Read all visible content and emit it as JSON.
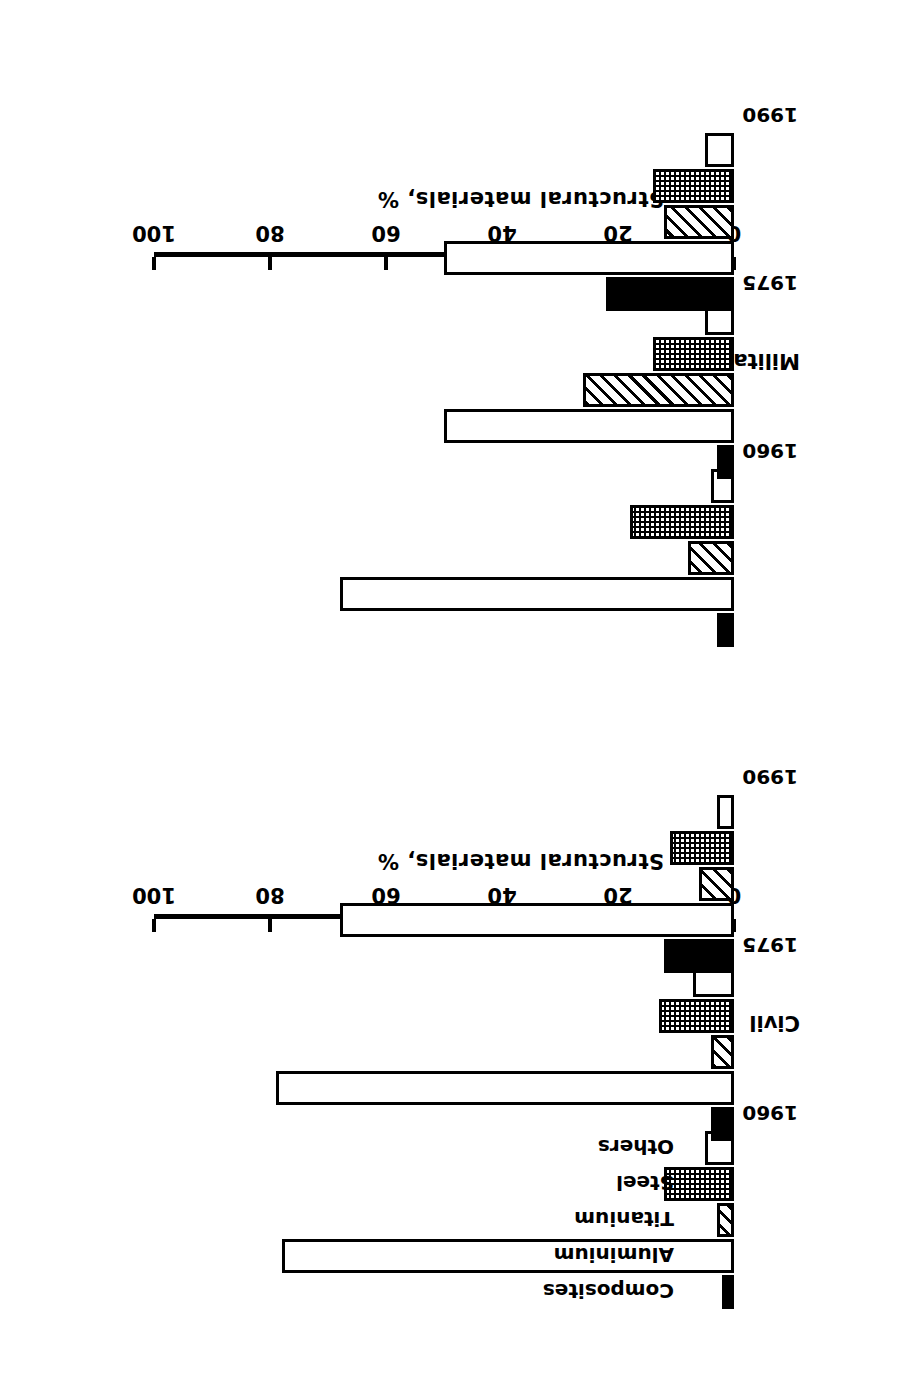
{
  "figure": {
    "orientation_note": "rotated-180",
    "panels": [
      {
        "title": "Civil"
      },
      {
        "title": "Military"
      }
    ],
    "axis": {
      "y_label": "Structural materials, %",
      "ticks": [
        "0",
        "20",
        "40",
        "60",
        "80",
        "100"
      ],
      "tick_values": [
        0,
        20,
        40,
        60,
        80,
        100
      ]
    },
    "years": [
      "1960",
      "1975",
      "1990"
    ],
    "material_labels": {
      "composites": "Composites",
      "aluminium": "Aluminium",
      "titanium": "Titanium",
      "steel": "Steel",
      "others": "Others"
    }
  },
  "chart_data": [
    {
      "type": "bar",
      "title": "Civil",
      "xlabel": "",
      "ylabel": "Structural materials, %",
      "ylim": [
        0,
        100
      ],
      "yticks": [
        0,
        20,
        40,
        60,
        80,
        100
      ],
      "grid": false,
      "legend": "inline labels above 1960 group",
      "categories": [
        "1960",
        "1975",
        "1990"
      ],
      "series": [
        {
          "name": "Composites",
          "fill": "solid",
          "values": [
            2,
            4,
            12
          ]
        },
        {
          "name": "Aluminium",
          "fill": "open",
          "values": [
            78,
            79,
            68
          ]
        },
        {
          "name": "Titanium",
          "fill": "hatch",
          "values": [
            3,
            4,
            6
          ]
        },
        {
          "name": "Steel",
          "fill": "dots",
          "values": [
            12,
            13,
            11
          ]
        },
        {
          "name": "Others",
          "fill": "open",
          "values": [
            5,
            7,
            3
          ]
        }
      ]
    },
    {
      "type": "bar",
      "title": "Military",
      "xlabel": "",
      "ylabel": "Structural materials, %",
      "ylim": [
        0,
        100
      ],
      "yticks": [
        0,
        20,
        40,
        60,
        80,
        100
      ],
      "grid": false,
      "legend": "shared with Civil panel",
      "categories": [
        "1960",
        "1975",
        "1990"
      ],
      "series": [
        {
          "name": "Composites",
          "fill": "solid",
          "values": [
            3,
            3,
            22
          ]
        },
        {
          "name": "Aluminium",
          "fill": "open",
          "values": [
            68,
            50,
            50
          ]
        },
        {
          "name": "Titanium",
          "fill": "hatch",
          "values": [
            8,
            26,
            12
          ]
        },
        {
          "name": "Steel",
          "fill": "dots",
          "values": [
            18,
            14,
            14
          ]
        },
        {
          "name": "Others",
          "fill": "open",
          "values": [
            4,
            5,
            5
          ]
        }
      ]
    }
  ]
}
